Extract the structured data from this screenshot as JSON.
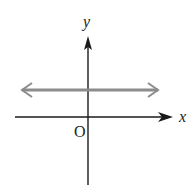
{
  "figure": {
    "type": "coordinate-plane",
    "axes": {
      "x_label": "x",
      "y_label": "y",
      "origin_label": "O"
    },
    "line": {
      "orientation": "horizontal",
      "position": "above x-axis",
      "both_ends_arrowed": true
    },
    "colors": {
      "axes": "#1a1a1a",
      "line": "#8c8c8c",
      "background": "#ffffff"
    }
  }
}
